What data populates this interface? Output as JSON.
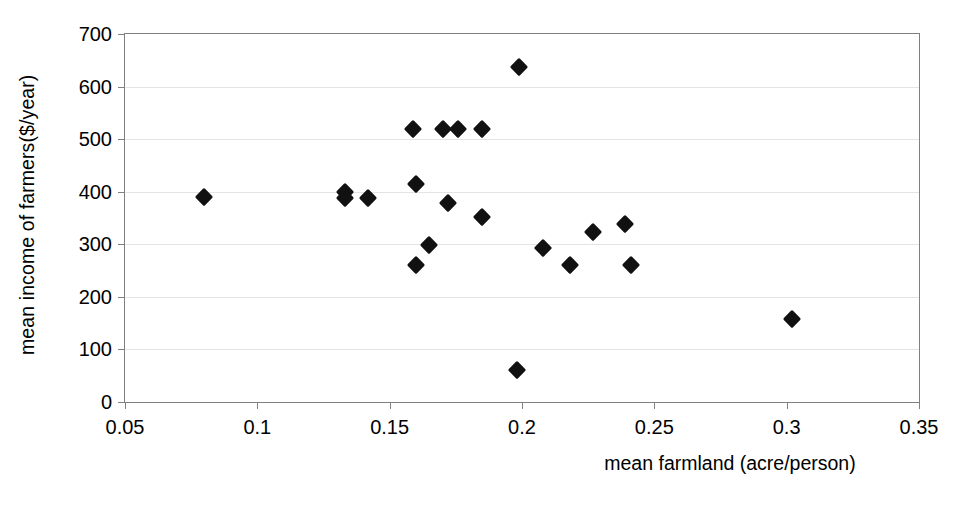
{
  "chart_data": {
    "type": "scatter",
    "title": "",
    "xlabel": "mean farmland (acre/person)",
    "ylabel": "mean income of farmers($/year)",
    "xlim": [
      0.05,
      0.35
    ],
    "ylim": [
      0,
      700
    ],
    "xticks": [
      "0.05",
      "0.1",
      "0.15",
      "0.2",
      "0.25",
      "0.3",
      "0.35"
    ],
    "xtick_values": [
      0.05,
      0.1,
      0.15,
      0.2,
      0.25,
      0.3,
      0.35
    ],
    "yticks": [
      "0",
      "100",
      "200",
      "300",
      "400",
      "500",
      "600",
      "700"
    ],
    "ytick_values": [
      0,
      100,
      200,
      300,
      400,
      500,
      600,
      700
    ],
    "grid": "horizontal",
    "legend": null,
    "marker": "filled-diamond",
    "marker_color": "#111111",
    "series": [
      {
        "name": "farms",
        "points": [
          {
            "x": 0.08,
            "y": 390
          },
          {
            "x": 0.133,
            "y": 400
          },
          {
            "x": 0.133,
            "y": 388
          },
          {
            "x": 0.142,
            "y": 388
          },
          {
            "x": 0.159,
            "y": 519
          },
          {
            "x": 0.16,
            "y": 414
          },
          {
            "x": 0.16,
            "y": 260
          },
          {
            "x": 0.165,
            "y": 299
          },
          {
            "x": 0.17,
            "y": 520
          },
          {
            "x": 0.176,
            "y": 520
          },
          {
            "x": 0.172,
            "y": 378
          },
          {
            "x": 0.185,
            "y": 520
          },
          {
            "x": 0.185,
            "y": 351
          },
          {
            "x": 0.199,
            "y": 638
          },
          {
            "x": 0.198,
            "y": 61
          },
          {
            "x": 0.208,
            "y": 293
          },
          {
            "x": 0.218,
            "y": 260
          },
          {
            "x": 0.227,
            "y": 323
          },
          {
            "x": 0.239,
            "y": 338
          },
          {
            "x": 0.241,
            "y": 260
          },
          {
            "x": 0.302,
            "y": 158
          }
        ]
      }
    ]
  }
}
